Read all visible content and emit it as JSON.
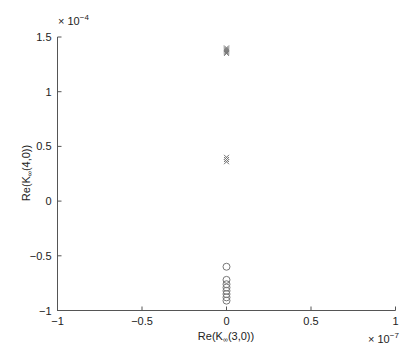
{
  "chart_data": {
    "type": "scatter",
    "title": "",
    "xlabel": "Re(K∞(3,0))",
    "xlabel_main": "Re(K",
    "xlabel_sub": "∞",
    "xlabel_tail": "(3,0))",
    "ylabel": "Re(K∞(4,0))",
    "ylabel_main": "Re(K",
    "ylabel_sub": "∞",
    "ylabel_tail": "(4,0))",
    "x_multiplier": "× 10",
    "x_multiplier_exp": "−7",
    "y_multiplier": "× 10",
    "y_multiplier_exp": "−4",
    "xlim": [
      -1,
      1
    ],
    "ylim": [
      -1,
      1.5
    ],
    "x_ticks": [
      -1,
      -0.5,
      0,
      0.5,
      1
    ],
    "x_tick_labels": [
      "−1",
      "−0.5",
      "0",
      "0.5",
      "1"
    ],
    "y_ticks": [
      -1,
      -0.5,
      0,
      0.5,
      1,
      1.5
    ],
    "y_tick_labels": [
      "−1",
      "−0.5",
      "0",
      "0.5",
      "1",
      "1.5"
    ],
    "grid": false,
    "legend": null,
    "series": [
      {
        "name": "cross-markers",
        "marker": "x",
        "color": "#777777",
        "x": [
          0,
          0,
          0,
          0,
          0,
          0
        ],
        "y": [
          1.4,
          1.39,
          1.38,
          1.37,
          1.36,
          1.35
        ]
      },
      {
        "name": "cross-markers-mid",
        "marker": "x",
        "color": "#777777",
        "x": [
          0,
          0,
          0
        ],
        "y": [
          0.4,
          0.38,
          0.36
        ]
      },
      {
        "name": "circle-markers",
        "marker": "o",
        "color": "#777777",
        "x": [
          0,
          0,
          0,
          0,
          0,
          0,
          0,
          0
        ],
        "y": [
          -0.6,
          -0.72,
          -0.76,
          -0.79,
          -0.82,
          -0.85,
          -0.88,
          -0.91
        ]
      }
    ]
  }
}
